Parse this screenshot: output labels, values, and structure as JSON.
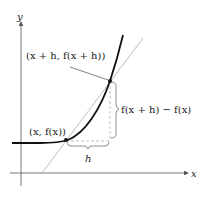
{
  "axes": {
    "x_label": "x",
    "y_label": "y"
  },
  "labels": {
    "point_a": "(x, f(x))",
    "point_b": "(x + h, f(x + h))",
    "rise": "f(x + h) − f(x)",
    "run": "h"
  },
  "colors": {
    "curve": "#111111",
    "secant": "#b5b5b5",
    "axis": "#555555",
    "dashed": "#aaaaaa"
  }
}
